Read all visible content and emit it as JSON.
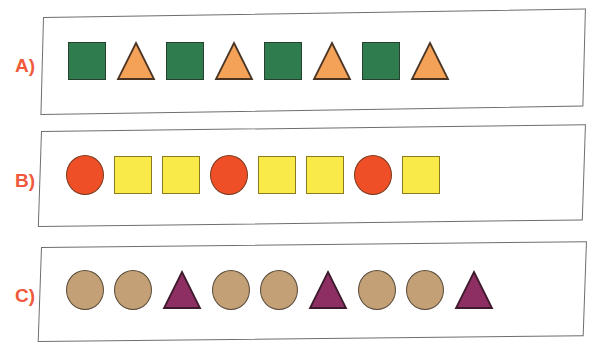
{
  "worksheet": {
    "background_color": "#ffffff",
    "box_border_color": "#6e6e72",
    "label_color": "#f0593a",
    "rows": [
      {
        "label": "A)",
        "label_name": "row-label-a",
        "pattern_code": "AB",
        "shape_count": 8,
        "shapes": [
          {
            "type": "square",
            "fill": "#2f7d4e",
            "stroke": "#27402f"
          },
          {
            "type": "triangle",
            "fill": "#f4a257",
            "stroke": "#4a3524"
          },
          {
            "type": "square",
            "fill": "#2f7d4e",
            "stroke": "#27402f"
          },
          {
            "type": "triangle",
            "fill": "#f4a257",
            "stroke": "#4a3524"
          },
          {
            "type": "square",
            "fill": "#2f7d4e",
            "stroke": "#27402f"
          },
          {
            "type": "triangle",
            "fill": "#f4a257",
            "stroke": "#4a3524"
          },
          {
            "type": "square",
            "fill": "#2f7d4e",
            "stroke": "#27402f"
          },
          {
            "type": "triangle",
            "fill": "#f4a257",
            "stroke": "#4a3524"
          }
        ]
      },
      {
        "label": "B)",
        "label_name": "row-label-b",
        "pattern_code": "ABB",
        "shape_count": 8,
        "shapes": [
          {
            "type": "circle",
            "fill": "#ef4f27",
            "stroke": "#7d3a1e"
          },
          {
            "type": "square",
            "fill": "#f9ea49",
            "stroke": "#8a7b1e"
          },
          {
            "type": "square",
            "fill": "#f9ea49",
            "stroke": "#8a7b1e"
          },
          {
            "type": "circle",
            "fill": "#ef4f27",
            "stroke": "#7d3a1e"
          },
          {
            "type": "square",
            "fill": "#f9ea49",
            "stroke": "#8a7b1e"
          },
          {
            "type": "square",
            "fill": "#f9ea49",
            "stroke": "#8a7b1e"
          },
          {
            "type": "circle",
            "fill": "#ef4f27",
            "stroke": "#7d3a1e"
          },
          {
            "type": "square",
            "fill": "#f9ea49",
            "stroke": "#8a7b1e"
          }
        ]
      },
      {
        "label": "C)",
        "label_name": "row-label-c",
        "pattern_code": "AAB",
        "shape_count": 9,
        "shapes": [
          {
            "type": "circle",
            "fill": "#c3a076",
            "stroke": "#5b4b3a"
          },
          {
            "type": "circle",
            "fill": "#c3a076",
            "stroke": "#5b4b3a"
          },
          {
            "type": "triangle",
            "fill": "#8e2f63",
            "stroke": "#3d1a2c"
          },
          {
            "type": "circle",
            "fill": "#c3a076",
            "stroke": "#5b4b3a"
          },
          {
            "type": "circle",
            "fill": "#c3a076",
            "stroke": "#5b4b3a"
          },
          {
            "type": "triangle",
            "fill": "#8e2f63",
            "stroke": "#3d1a2c"
          },
          {
            "type": "circle",
            "fill": "#c3a076",
            "stroke": "#5b4b3a"
          },
          {
            "type": "circle",
            "fill": "#c3a076",
            "stroke": "#5b4b3a"
          },
          {
            "type": "triangle",
            "fill": "#8e2f63",
            "stroke": "#3d1a2c"
          }
        ]
      }
    ]
  }
}
